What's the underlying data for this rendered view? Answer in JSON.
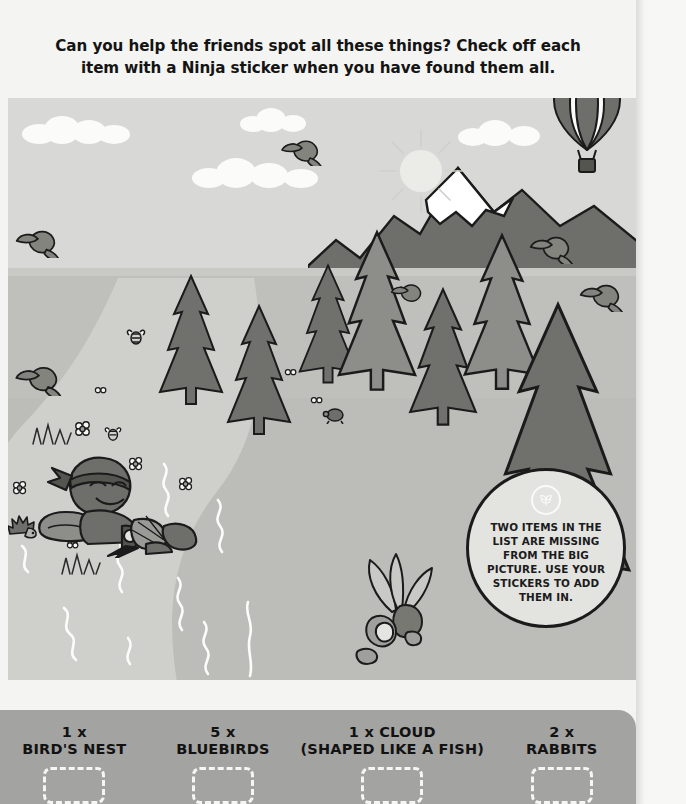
{
  "header": {
    "line1": "Can you help the friends spot all these things? Check off each",
    "line2": "item with a Ninja sticker when you have found them all."
  },
  "callout": {
    "logo_icon": "leaf-badge-icon",
    "text": "TWO ITEMS IN THE LIST ARE MISSING FROM THE BIG PICTURE. USE YOUR STICKERS TO ADD THEM IN."
  },
  "scene": {
    "elements": [
      "hot-air-balloon",
      "sun",
      "clouds",
      "snow-capped-mountain",
      "pine-trees",
      "river",
      "meadow",
      "reclining-ninja",
      "birds",
      "bees",
      "hedgehog",
      "turtle",
      "flowers",
      "grass-tufts",
      "plant-with-rocks"
    ],
    "colors": {
      "sky": "#d8d8d6",
      "mountain": "#6e6e6b",
      "snow": "#ffffff",
      "meadow": "#bfbfbc",
      "river": "#cccbc8",
      "tree_dark": "#70706d",
      "tree_light": "#9a9a97",
      "panel": "#a3a3a1",
      "ink": "#1b1b1b"
    }
  },
  "checklist": {
    "items": [
      {
        "qty": "1 x",
        "name": "BIRD'S NEST",
        "checkbox": "empty"
      },
      {
        "qty": "5 x",
        "name": "BLUEBIRDS",
        "checkbox": "empty"
      },
      {
        "qty": "1 x CLOUD",
        "name": "(SHAPED LIKE A FISH)",
        "checkbox": "empty"
      },
      {
        "qty": "2 x",
        "name": "RABBITS",
        "checkbox": "empty"
      }
    ]
  }
}
